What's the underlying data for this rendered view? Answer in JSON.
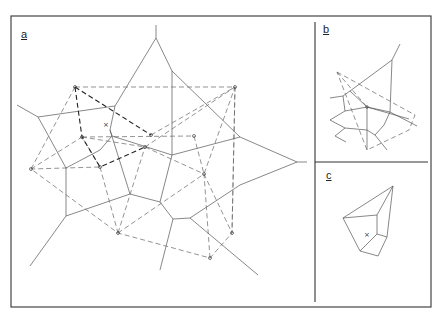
{
  "figure": {
    "panels": [
      {
        "id": "a",
        "label": "a"
      },
      {
        "id": "b",
        "label": "b"
      },
      {
        "id": "c",
        "label": "c"
      }
    ]
  },
  "colors": {
    "line": "#555555",
    "frame": "#333333",
    "background": "#ffffff"
  }
}
